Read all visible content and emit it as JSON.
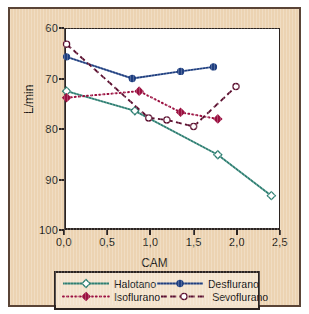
{
  "axes": {
    "xlabel": "CAM",
    "ylabel": "L/min",
    "xticks": [
      "0,0",
      "0,5",
      "1,0",
      "1,5",
      "2,0",
      "2,5"
    ],
    "yticks": [
      "100",
      "90",
      "80",
      "70",
      "60"
    ]
  },
  "legend": {
    "items": [
      {
        "label": "Halotano",
        "color": "#2e7f72",
        "style": "solid",
        "marker": "open-diamond"
      },
      {
        "label": "Desflurano",
        "color": "#1f3f80",
        "style": "solid",
        "marker": "filled-circle"
      },
      {
        "label": "Isoflurano",
        "color": "#9b1040",
        "style": "dotted",
        "marker": "filled-diamond"
      },
      {
        "label": "Sevoflurano",
        "color": "#5c1030",
        "style": "dashed",
        "marker": "open-circle"
      }
    ]
  },
  "chart_data": {
    "type": "line",
    "title": "",
    "xlabel": "CAM",
    "ylabel": "L/min",
    "xlim": [
      0.0,
      2.5
    ],
    "ylim": [
      60,
      100
    ],
    "xticks": [
      0.0,
      0.5,
      1.0,
      1.5,
      2.0,
      2.5
    ],
    "yticks": [
      60,
      70,
      80,
      90,
      100
    ],
    "grid": false,
    "legend_position": "below",
    "series": [
      {
        "name": "Halotano",
        "color": "#2e7f72",
        "line_style": "solid",
        "marker": "open-diamond",
        "x": [
          0.03,
          0.82,
          1.78,
          2.4
        ],
        "y": [
          87.5,
          83.6,
          74.9,
          66.8
        ]
      },
      {
        "name": "Desflurano",
        "color": "#1f3f80",
        "line_style": "solid",
        "marker": "filled-circle",
        "x": [
          0.03,
          0.79,
          1.35,
          1.73
        ],
        "y": [
          94.3,
          90.0,
          91.4,
          92.3
        ]
      },
      {
        "name": "Isoflurano",
        "color": "#9b1040",
        "line_style": "dotted",
        "marker": "filled-diamond",
        "x": [
          0.03,
          0.87,
          1.35,
          1.78
        ],
        "y": [
          86.2,
          87.5,
          83.3,
          82.0
        ]
      },
      {
        "name": "Sevoflurano",
        "color": "#5c1030",
        "line_style": "dashed",
        "marker": "open-circle",
        "x": [
          0.03,
          0.98,
          1.19,
          1.5,
          1.99
        ],
        "y": [
          96.8,
          82.2,
          81.8,
          80.5,
          88.4
        ]
      }
    ]
  }
}
